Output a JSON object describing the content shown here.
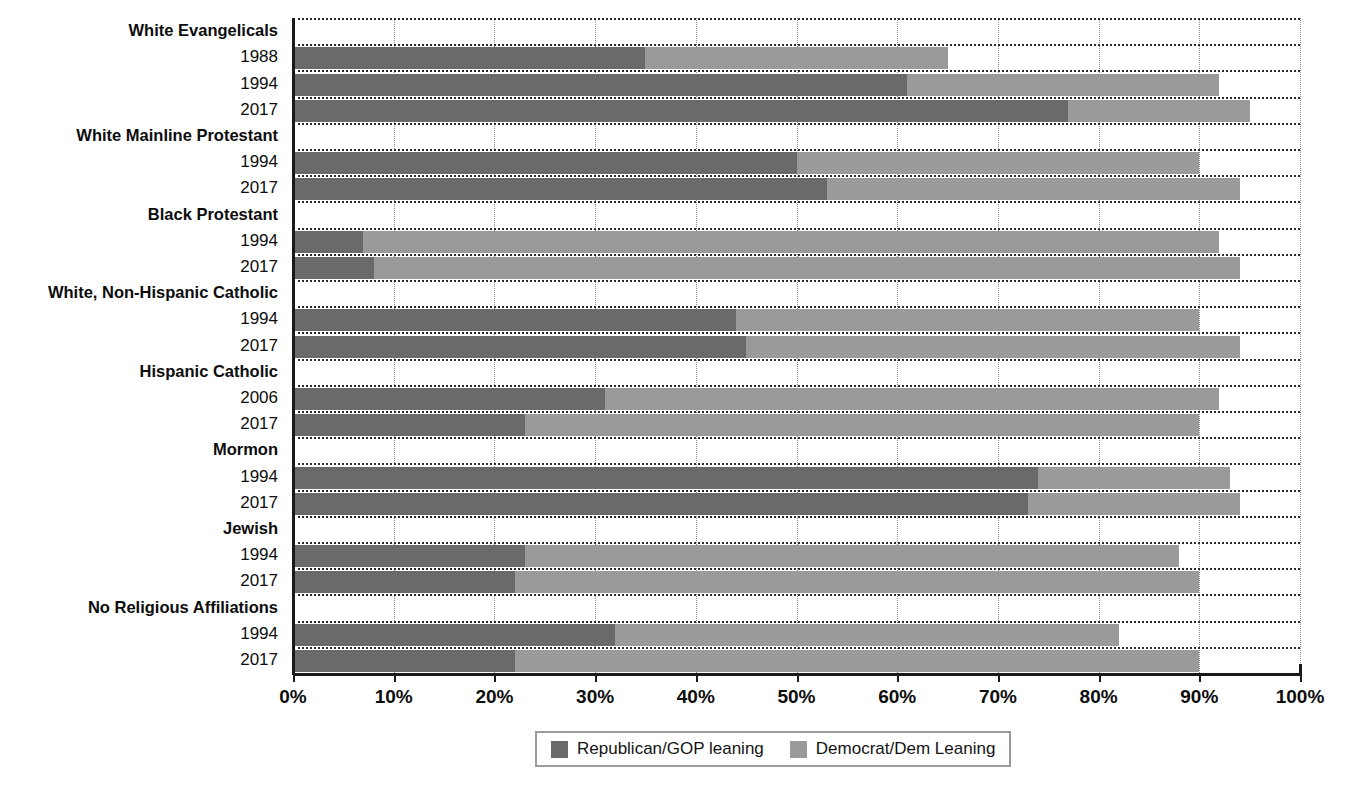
{
  "chart_data": {
    "type": "bar",
    "title": "",
    "xlabel": "",
    "ylabel": "",
    "xlim": [
      0,
      100
    ],
    "grid": true,
    "orientation": "horizontal",
    "stacked": true,
    "legend_position": "bottom",
    "legend": [
      "Republican/GOP leaning",
      "Democrat/Dem Leaning"
    ],
    "colors": {
      "republican": "#6a6a6a",
      "democrat": "#9a9a9a"
    },
    "xticks": [
      "0%",
      "10%",
      "20%",
      "30%",
      "40%",
      "50%",
      "60%",
      "70%",
      "80%",
      "90%",
      "100%"
    ],
    "xtick_values": [
      0,
      10,
      20,
      30,
      40,
      50,
      60,
      70,
      80,
      90,
      100
    ],
    "series": [
      {
        "name": "Republican/GOP leaning",
        "values": [
          35,
          61,
          77,
          50,
          53,
          7,
          8,
          44,
          45,
          31,
          23,
          74,
          73,
          23,
          22,
          32,
          22
        ]
      },
      {
        "name": "Democrat/Dem Leaning",
        "values": [
          30,
          31,
          18,
          40,
          41,
          85,
          86,
          46,
          49,
          61,
          67,
          19,
          21,
          65,
          68,
          50,
          68
        ]
      }
    ],
    "rows": [
      {
        "kind": "group",
        "label": "White Evangelicals",
        "republican": null,
        "democrat": null,
        "total": null
      },
      {
        "kind": "year",
        "label": "1988",
        "republican": 35,
        "democrat": 30,
        "total": 65
      },
      {
        "kind": "year",
        "label": "1994",
        "republican": 61,
        "democrat": 31,
        "total": 92
      },
      {
        "kind": "year",
        "label": "2017",
        "republican": 77,
        "democrat": 18,
        "total": 95
      },
      {
        "kind": "group",
        "label": "White Mainline Protestant",
        "republican": null,
        "democrat": null,
        "total": null
      },
      {
        "kind": "year",
        "label": "1994",
        "republican": 50,
        "democrat": 40,
        "total": 90
      },
      {
        "kind": "year",
        "label": "2017",
        "republican": 53,
        "democrat": 41,
        "total": 94
      },
      {
        "kind": "group",
        "label": "Black Protestant",
        "republican": null,
        "democrat": null,
        "total": null
      },
      {
        "kind": "year",
        "label": "1994",
        "republican": 7,
        "democrat": 85,
        "total": 92
      },
      {
        "kind": "year",
        "label": "2017",
        "republican": 8,
        "democrat": 86,
        "total": 94
      },
      {
        "kind": "group",
        "label": "White, Non-Hispanic Catholic",
        "republican": null,
        "democrat": null,
        "total": null
      },
      {
        "kind": "year",
        "label": "1994",
        "republican": 44,
        "democrat": 46,
        "total": 90
      },
      {
        "kind": "year",
        "label": "2017",
        "republican": 45,
        "democrat": 49,
        "total": 94
      },
      {
        "kind": "group",
        "label": "Hispanic Catholic",
        "republican": null,
        "democrat": null,
        "total": null
      },
      {
        "kind": "year",
        "label": "2006",
        "republican": 31,
        "democrat": 61,
        "total": 92
      },
      {
        "kind": "year",
        "label": "2017",
        "republican": 23,
        "democrat": 67,
        "total": 90
      },
      {
        "kind": "group",
        "label": "Mormon",
        "republican": null,
        "democrat": null,
        "total": null
      },
      {
        "kind": "year",
        "label": "1994",
        "republican": 74,
        "democrat": 19,
        "total": 93
      },
      {
        "kind": "year",
        "label": "2017",
        "republican": 73,
        "democrat": 21,
        "total": 94
      },
      {
        "kind": "group",
        "label": "Jewish",
        "republican": null,
        "democrat": null,
        "total": null
      },
      {
        "kind": "year",
        "label": "1994",
        "republican": 23,
        "democrat": 65,
        "total": 88
      },
      {
        "kind": "year",
        "label": "2017",
        "republican": 22,
        "democrat": 68,
        "total": 90
      },
      {
        "kind": "group",
        "label": "No Religious Affiliations",
        "republican": null,
        "democrat": null,
        "total": null
      },
      {
        "kind": "year",
        "label": "1994",
        "republican": 32,
        "democrat": 50,
        "total": 82
      },
      {
        "kind": "year",
        "label": "2017",
        "republican": 22,
        "democrat": 68,
        "total": 90
      }
    ]
  }
}
